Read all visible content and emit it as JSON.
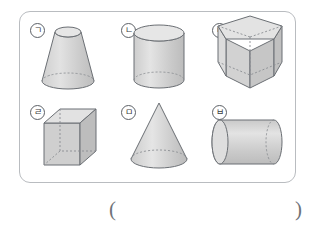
{
  "figure": {
    "frame_border_color": "#b9bcc0",
    "shape_fill_color": "#d9d9d9",
    "shape_stroke_color": "#6b6f74",
    "hidden_edge_style": "dashed"
  },
  "shapes": [
    {
      "id": "shape-a",
      "label": "ㄱ",
      "name": "truncated-cone",
      "description": "원뿔 (frustum of a cone) standing upright, narrow top ellipse, wide bottom ellipse with dashed hidden back edge"
    },
    {
      "id": "shape-b",
      "label": "ㄴ",
      "name": "cylinder-upright",
      "description": "원기둥 (cylinder) standing upright, top ellipse visible, bottom back edge dashed"
    },
    {
      "id": "shape-c",
      "label": "ㄷ",
      "name": "pentagonal-prism",
      "description": "오각기둥 (pentagonal prism) upright with dashed hidden rear edges"
    },
    {
      "id": "shape-d",
      "label": "ㄹ",
      "name": "rectangular-prism",
      "description": "직육면체 (cube / rectangular prism) with dashed hidden edges"
    },
    {
      "id": "shape-e",
      "label": "ㅁ",
      "name": "cone",
      "description": "원뿔 (cone) with apex on top and base ellipse, back half of base dashed"
    },
    {
      "id": "shape-f",
      "label": "ㅂ",
      "name": "cylinder-horizontal",
      "description": "원기둥 (cylinder) lying on its side, left ellipse face visible, right end dashed"
    }
  ],
  "answer": {
    "paren_open": "(",
    "paren_close": ")",
    "value": ""
  }
}
